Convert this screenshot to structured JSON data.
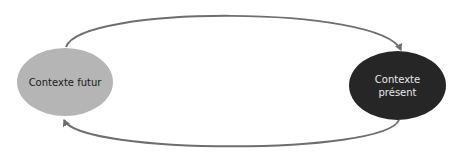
{
  "diagram": {
    "nodes": [
      {
        "id": "future",
        "label": "Contexte futur",
        "fill": "#b5b5b5"
      },
      {
        "id": "present",
        "label": "Contexte présent",
        "fill": "#262626"
      }
    ],
    "edges": [
      {
        "from": "future",
        "to": "present",
        "path": "top"
      },
      {
        "from": "present",
        "to": "future",
        "path": "bottom"
      }
    ],
    "arrow_color": "#6e6e6e"
  }
}
